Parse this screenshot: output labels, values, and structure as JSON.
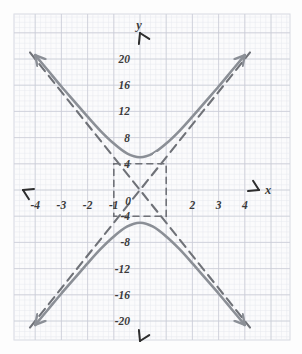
{
  "figure": {
    "kind": "hand-drawn-graph-paper",
    "background_color": "#fdfdfd",
    "paper_color": "#fbfbfc",
    "minor_grid_color": "#e6e8ee",
    "major_grid_color": "#c9ccd6",
    "axis_color": "#2e2e2e",
    "curve_color": "#8b8f96",
    "asymptote_color": "#6f7278"
  },
  "axes": {
    "x_axis_label": "x",
    "y_axis_label": "y",
    "origin_label": "0",
    "x_ticks": [
      {
        "value": -4,
        "label": "-4"
      },
      {
        "value": -3,
        "label": "-3"
      },
      {
        "value": -2,
        "label": "-2"
      },
      {
        "value": -1,
        "label": "-1"
      },
      {
        "value": 1,
        "label": ""
      },
      {
        "value": 2,
        "label": "2"
      },
      {
        "value": 3,
        "label": "3"
      },
      {
        "value": 4,
        "label": "4"
      }
    ],
    "y_ticks": [
      {
        "value": 20,
        "label": "20"
      },
      {
        "value": 16,
        "label": "16"
      },
      {
        "value": 12,
        "label": "12"
      },
      {
        "value": 8,
        "label": "8"
      },
      {
        "value": 4,
        "label": "4"
      },
      {
        "value": -4,
        "label": "-4"
      },
      {
        "value": -8,
        "label": "-8"
      },
      {
        "value": -12,
        "label": "-12"
      },
      {
        "value": -16,
        "label": "-16"
      },
      {
        "value": -20,
        "label": "-20"
      }
    ],
    "x_range": [
      -4.6,
      4.6
    ],
    "y_range": [
      -22.5,
      22.5
    ]
  },
  "chart_data": {
    "type": "line",
    "title": "",
    "xlabel": "x",
    "ylabel": "y",
    "xlim": [
      -4.6,
      4.6
    ],
    "ylim": [
      -22.5,
      22.5
    ],
    "grid": true,
    "legend": "none",
    "series": [
      {
        "name": "hyperbola-upper-branch",
        "style": "solid",
        "color": "#8b8f96",
        "arrows": [
          "start",
          "end"
        ],
        "x": [
          -4.0,
          -3.5,
          -3.0,
          -2.5,
          -2.0,
          -1.5,
          -1.0,
          -0.5,
          0.0,
          0.5,
          1.0,
          1.5,
          2.0,
          2.5,
          3.0,
          3.5,
          4.0
        ],
        "y": [
          20.6,
          18.2,
          15.8,
          13.5,
          11.2,
          9.0,
          7.1,
          5.6,
          5.0,
          5.6,
          7.1,
          9.0,
          11.2,
          13.5,
          15.8,
          18.2,
          20.6
        ]
      },
      {
        "name": "hyperbola-lower-branch",
        "style": "solid",
        "color": "#8b8f96",
        "arrows": [
          "start",
          "end"
        ],
        "x": [
          -4.0,
          -3.5,
          -3.0,
          -2.5,
          -2.0,
          -1.5,
          -1.0,
          -0.5,
          0.0,
          0.5,
          1.0,
          1.5,
          2.0,
          2.5,
          3.0,
          3.5,
          4.0
        ],
        "y": [
          -20.6,
          -18.2,
          -15.8,
          -13.5,
          -11.2,
          -9.0,
          -7.1,
          -5.6,
          -5.0,
          -5.6,
          -7.1,
          -9.0,
          -11.2,
          -13.5,
          -15.8,
          -18.2,
          -20.6
        ]
      },
      {
        "name": "asymptote-positive-slope",
        "style": "dashed",
        "color": "#6f7278",
        "x": [
          -4.2,
          4.2
        ],
        "y": [
          -21.0,
          21.0
        ]
      },
      {
        "name": "asymptote-negative-slope",
        "style": "dashed",
        "color": "#6f7278",
        "x": [
          -4.2,
          4.2
        ],
        "y": [
          21.0,
          -21.0
        ]
      }
    ],
    "annotations": [
      {
        "name": "fundamental-rectangle",
        "style": "dashed",
        "x_min": -1,
        "x_max": 1,
        "y_min": -4,
        "y_max": 4
      }
    ],
    "vertices": [
      {
        "x": 0,
        "y": 5
      },
      {
        "x": 0,
        "y": -5
      }
    ]
  }
}
